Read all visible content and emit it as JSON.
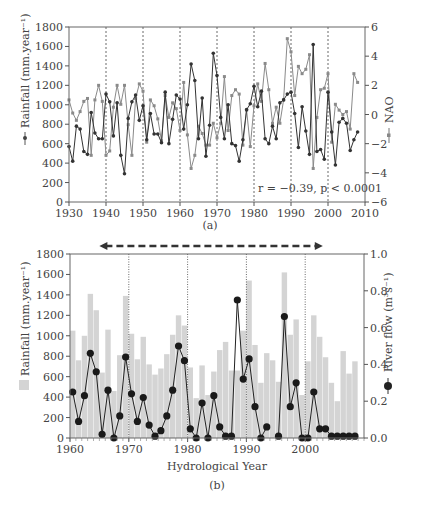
{
  "figure": {
    "panel_a_label": "(a)",
    "panel_b_label": "(b)"
  },
  "chart_data": [
    {
      "type": "line",
      "panel": "(a)",
      "xlabel": "",
      "ylabel": "Rainfall (mm.year⁻¹)",
      "y2label": "NAO",
      "xlim": [
        1930,
        2010
      ],
      "ylim": [
        0,
        1800
      ],
      "y2lim": [
        -6,
        6
      ],
      "xticks": [
        1930,
        1940,
        1950,
        1960,
        1970,
        1980,
        1990,
        2000,
        2010
      ],
      "yticks": [
        0,
        200,
        400,
        600,
        800,
        1000,
        1200,
        1400,
        1600,
        1800
      ],
      "y2ticks": [
        -6,
        -4,
        -2,
        0,
        2,
        4,
        6
      ],
      "vlines": [
        1940,
        1950,
        1960,
        1970,
        1980,
        1990,
        2000
      ],
      "annotation": "r = −0.39, p < 0.0001",
      "x": [
        1930,
        1931,
        1932,
        1933,
        1934,
        1935,
        1936,
        1937,
        1938,
        1939,
        1940,
        1941,
        1942,
        1943,
        1944,
        1945,
        1946,
        1947,
        1948,
        1949,
        1950,
        1951,
        1952,
        1953,
        1954,
        1955,
        1956,
        1957,
        1958,
        1959,
        1960,
        1961,
        1962,
        1963,
        1964,
        1965,
        1966,
        1967,
        1968,
        1969,
        1970,
        1971,
        1972,
        1973,
        1974,
        1975,
        1976,
        1977,
        1978,
        1979,
        1980,
        1981,
        1982,
        1983,
        1984,
        1985,
        1986,
        1987,
        1988,
        1989,
        1990,
        1991,
        1992,
        1993,
        1994,
        1995,
        1996,
        1997,
        1998,
        1999,
        2000,
        2001,
        2002,
        2003,
        2004,
        2005,
        2006,
        2007,
        2008
      ],
      "series": [
        {
          "name": "Rainfall",
          "axis": "left",
          "marker": "dark",
          "values": [
            570,
            420,
            780,
            750,
            520,
            490,
            920,
            710,
            650,
            650,
            1110,
            1030,
            680,
            1020,
            480,
            290,
            860,
            1030,
            1100,
            840,
            990,
            640,
            910,
            700,
            700,
            610,
            1130,
            600,
            850,
            1100,
            1060,
            750,
            1000,
            1420,
            1250,
            650,
            1070,
            470,
            790,
            1530,
            1300,
            870,
            650,
            1000,
            600,
            580,
            420,
            640,
            950,
            1010,
            1190,
            980,
            1140,
            650,
            600,
            780,
            650,
            1020,
            1050,
            1110,
            1130,
            910,
            560,
            980,
            730,
            490,
            1620,
            520,
            540,
            440,
            1130,
            720,
            380,
            820,
            860,
            810,
            530,
            640,
            720
          ]
        },
        {
          "name": "NAO",
          "axis": "right",
          "marker": "grey",
          "values": [
            1.0,
            0.1,
            -0.4,
            0.2,
            0.9,
            1.1,
            -2.8,
            1.0,
            2.0,
            0.9,
            -2.8,
            -2.5,
            0.5,
            2.0,
            0.7,
            2.0,
            -0.7,
            -2.8,
            1.1,
            2.1,
            1.6,
            -1.9,
            1.0,
            0.6,
            -0.3,
            -1.8,
            1.3,
            -0.2,
            0.8,
            0.4,
            -1.1,
            2.2,
            -1.4,
            -3.7,
            -2.8,
            -0.8,
            -1.3,
            -2.1,
            -2.1,
            -0.6,
            -1.6,
            -0.6,
            2.6,
            -1.1,
            1.3,
            1.7,
            1.4,
            -2.1,
            0.3,
            -2.2,
            0.6,
            2.1,
            0.9,
            3.5,
            1.7,
            -0.6,
            0.5,
            -0.6,
            1.0,
            5.2,
            4.3,
            1.3,
            3.3,
            2.8,
            3.1,
            4.1,
            -3.7,
            -0.2,
            1.7,
            1.8,
            2.8,
            -1.9,
            0.7,
            0.3,
            0.0,
            0.2,
            -1.0,
            2.8,
            2.2
          ]
        }
      ]
    },
    {
      "type": "bar+line",
      "panel": "(b)",
      "xlabel": "Hydrological Year",
      "ylabel": "Rainfall (mm.year⁻¹)",
      "y2label": "River flow (m³s⁻¹)",
      "xlim": [
        1960,
        2010
      ],
      "ylim": [
        0,
        1800
      ],
      "y2lim": [
        0.0,
        1.0
      ],
      "xticks": [
        1960,
        1970,
        1980,
        1990,
        2000
      ],
      "yticks": [
        0,
        200,
        400,
        600,
        800,
        1000,
        1200,
        1400,
        1600,
        1800
      ],
      "y2ticks": [
        0.0,
        0.2,
        0.4,
        0.6,
        0.8,
        1.0
      ],
      "vlines": [
        1970,
        1980,
        1990,
        2000
      ],
      "arrow": {
        "from": 1965,
        "to": 2003,
        "style": "dashed double-headed"
      },
      "x": [
        1960,
        1961,
        1962,
        1963,
        1964,
        1965,
        1966,
        1967,
        1968,
        1969,
        1970,
        1971,
        1972,
        1973,
        1974,
        1975,
        1976,
        1977,
        1978,
        1979,
        1980,
        1981,
        1982,
        1983,
        1984,
        1985,
        1986,
        1987,
        1988,
        1989,
        1990,
        1991,
        1992,
        1993,
        1994,
        1995,
        1996,
        1997,
        1998,
        1999,
        2000,
        2001,
        2002,
        2003,
        2004,
        2005,
        2006,
        2007,
        2008
      ],
      "series": [
        {
          "name": "Rainfall",
          "kind": "bar",
          "axis": "left",
          "color": "#d4d4d4",
          "values": [
            1050,
            760,
            1000,
            1410,
            1250,
            640,
            1060,
            460,
            810,
            1390,
            1020,
            770,
            990,
            720,
            620,
            680,
            820,
            1010,
            1200,
            1100,
            690,
            390,
            710,
            420,
            650,
            860,
            940,
            660,
            660,
            1050,
            1540,
            910,
            540,
            830,
            760,
            550,
            1620,
            1010,
            1160,
            420,
            750,
            1200,
            990,
            790,
            540,
            360,
            850,
            630,
            750
          ]
        },
        {
          "name": "River flow",
          "kind": "line",
          "axis": "right",
          "marker": "large-dark-circle",
          "values": [
            0.25,
            0.09,
            0.23,
            0.46,
            0.36,
            0.02,
            0.26,
            0.0,
            0.12,
            0.44,
            0.24,
            0.09,
            0.22,
            0.07,
            0.01,
            0.04,
            0.12,
            0.26,
            0.5,
            0.42,
            0.05,
            0.0,
            0.19,
            0.0,
            0.23,
            0.06,
            0.01,
            0.01,
            0.75,
            0.32,
            0.43,
            0.17,
            0.0,
            0.06,
            null,
            0.01,
            0.66,
            0.17,
            0.3,
            0.0,
            0.0,
            0.25,
            0.05,
            0.05,
            0.01,
            0.01,
            0.01,
            0.01,
            0.01
          ]
        }
      ]
    }
  ]
}
